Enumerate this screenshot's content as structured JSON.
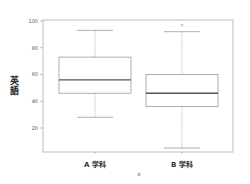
{
  "chart_data": {
    "type": "box",
    "title": "",
    "xlabel": "x",
    "ylabel": "英語",
    "ylim": [
      0,
      100
    ],
    "yticks": [
      20,
      40,
      60,
      80,
      100
    ],
    "categories": [
      "A 学科",
      "B 学科"
    ],
    "boxes": [
      {
        "name": "A 学科",
        "whisker_low": 28,
        "q1": 46,
        "median": 56,
        "q3": 73,
        "whisker_high": 93,
        "outliers": []
      },
      {
        "name": "B 学科",
        "whisker_low": 5,
        "q1": 36,
        "median": 46,
        "q3": 60,
        "whisker_high": 92,
        "outliers": [
          97
        ]
      }
    ],
    "grid": false,
    "legend": "none"
  }
}
